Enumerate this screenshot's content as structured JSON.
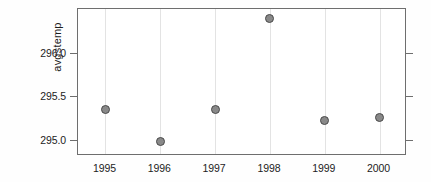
{
  "chart_data": {
    "type": "scatter",
    "title": "",
    "xlabel": "",
    "ylabel": "avgstemp",
    "categories": [
      "1995",
      "1996",
      "1997",
      "1998",
      "1999",
      "2000"
    ],
    "x": [
      1995,
      1996,
      1997,
      1998,
      1999,
      2000
    ],
    "values": [
      295.37,
      295.0,
      295.37,
      296.41,
      295.24,
      295.27
    ],
    "series": [
      {
        "name": "avgstemp",
        "values": [
          295.37,
          295.0,
          295.37,
          296.41,
          295.24,
          295.27
        ]
      }
    ],
    "ytick_labels": [
      "296.0",
      "295.5",
      "295.0"
    ],
    "ytick_values": [
      296.0,
      295.5,
      295.0
    ],
    "xtick_labels": [
      "1995",
      "1996",
      "1997",
      "1998",
      "1999",
      "2000"
    ],
    "ylim": [
      294.83,
      296.52
    ],
    "xlim": [
      1994.5,
      2000.5
    ],
    "grid": "vertical",
    "legend": "none",
    "marker_fill": "#898989",
    "marker_edge": "#4a4a4a",
    "axis_color": "#6e6e6e",
    "gridline_color": "#e3e3e3",
    "background": "#ffffff"
  },
  "axes": {
    "y_title": "avgstemp",
    "y_ticks": [
      {
        "label": "296.0",
        "value": 296.0
      },
      {
        "label": "295.5",
        "value": 295.5
      },
      {
        "label": "295.0",
        "value": 295.0
      }
    ],
    "x_ticks": [
      {
        "label": "1995",
        "value": 1995
      },
      {
        "label": "1996",
        "value": 1996
      },
      {
        "label": "1997",
        "value": 1997
      },
      {
        "label": "1998",
        "value": 1998
      },
      {
        "label": "1999",
        "value": 1999
      },
      {
        "label": "2000",
        "value": 2000
      }
    ]
  }
}
